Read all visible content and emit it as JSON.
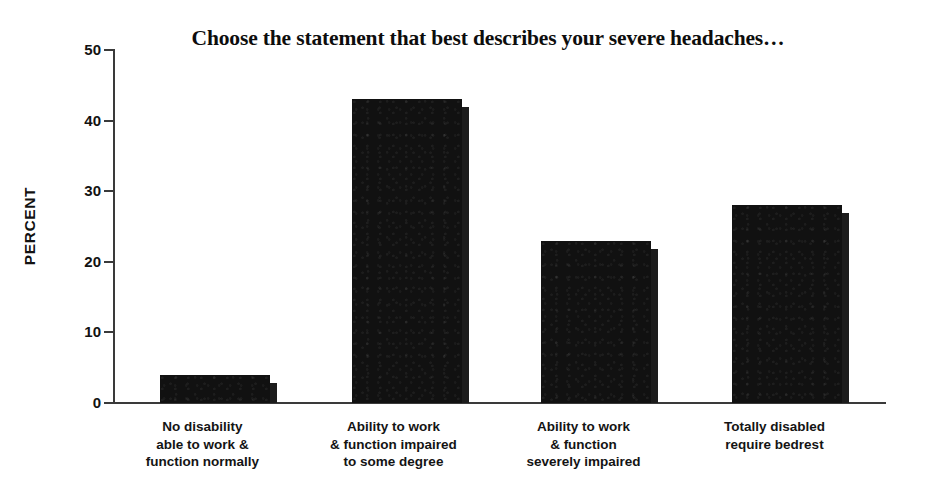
{
  "chart_data": {
    "type": "bar",
    "title": "Choose the statement that best describes your severe headaches…",
    "xlabel": "",
    "ylabel": "PERCENT",
    "categories": [
      "No disability able to work & function normally",
      "Ability to work & function impaired to some degree",
      "Ability to work & function severely impaired",
      "Totally disabled require bedrest"
    ],
    "category_lines": [
      [
        "No disability",
        "able to work &",
        "function normally"
      ],
      [
        "Ability to work",
        "& function impaired",
        "to some degree"
      ],
      [
        "Ability to work",
        "& function",
        "severely impaired"
      ],
      [
        "Totally disabled",
        "require bedrest"
      ]
    ],
    "values": [
      4,
      43,
      23,
      28
    ],
    "ylim": [
      0,
      50
    ],
    "yticks": [
      0,
      10,
      20,
      30,
      40,
      50
    ],
    "ytick_labels": [
      "0",
      "10",
      "20",
      "30",
      "40",
      "50"
    ],
    "grid": false,
    "legend": false,
    "bar_color": "#111111",
    "axis_color": "#3a3a3a",
    "text_color": "#121212",
    "background": "#ffffff"
  }
}
